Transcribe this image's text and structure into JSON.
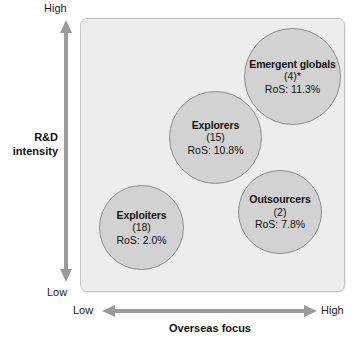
{
  "chart_data": {
    "type": "scatter",
    "title": "",
    "xlabel": "Overseas focus",
    "ylabel": "R&D intensity",
    "x_low_label": "Low",
    "x_high_label": "High",
    "y_low_label": "Low",
    "y_high_label": "High",
    "grid": false,
    "legend": "none",
    "axis_note": "Qualitative axes: Overseas focus (Low to High) vs R&D intensity (Low to High)",
    "bubbles": [
      {
        "name": "Emergent globals",
        "count_label": "(4)*",
        "count": 4,
        "ros_label": "RoS: 11.3%",
        "ros": 11.3,
        "x_qual": "high",
        "y_qual": "high"
      },
      {
        "name": "Explorers",
        "count_label": "(15)",
        "count": 15,
        "ros_label": "RoS: 10.8%",
        "ros": 10.8,
        "x_qual": "medium",
        "y_qual": "medium-high"
      },
      {
        "name": "Outsourcers",
        "count_label": "(2)",
        "count": 2,
        "ros_label": "RoS: 7.8%",
        "ros": 7.8,
        "x_qual": "high",
        "y_qual": "low-medium"
      },
      {
        "name": "Exploiters",
        "count_label": "(18)",
        "count": 18,
        "ros_label": "RoS: 2.0%",
        "ros": 2.0,
        "x_qual": "low",
        "y_qual": "low"
      }
    ]
  },
  "colors": {
    "panel_background": "#ededed",
    "panel_border": "#c6c6c6",
    "bubble_fill": "#d2d2d2",
    "bubble_border": "#8d8d8d",
    "arrow": "#9a9a9a",
    "text": "#111111",
    "page_background": "#ffffff"
  }
}
